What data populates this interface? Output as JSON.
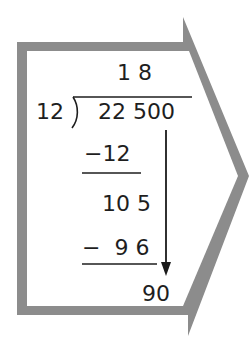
{
  "diagram": {
    "type": "long-division",
    "frame": {
      "shape": "right-pointing-arrow-outline",
      "stroke_color": "#8c8c8c",
      "fill_color": "#ffffff"
    },
    "quotient": "1 8",
    "divisor": "12",
    "dividend": "22 500",
    "steps": [
      {
        "role": "subtract",
        "text": "−12"
      },
      {
        "role": "remainder-bring-down",
        "text": "10 5"
      },
      {
        "role": "subtract",
        "text": "−  9 6"
      },
      {
        "role": "remainder-bring-down",
        "text": "90"
      }
    ],
    "bring_down_arrow": {
      "direction": "down",
      "color": "#1a1a1a"
    }
  }
}
